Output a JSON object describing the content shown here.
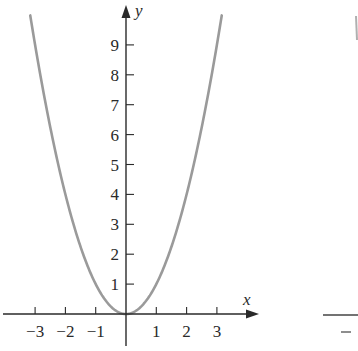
{
  "chart_data": {
    "type": "line",
    "title": "",
    "function": "y = x^2",
    "xlabel": "x",
    "ylabel": "y",
    "xlim": [
      -4.1,
      4.4
    ],
    "ylim": [
      -1.1,
      10.3
    ],
    "x_ticks": [
      -3,
      -2,
      -1,
      1,
      2,
      3
    ],
    "x_tick_labels": [
      "−3",
      "−2",
      "−1",
      "1",
      "2",
      "3"
    ],
    "y_ticks": [
      1,
      2,
      3,
      4,
      5,
      6,
      7,
      8,
      9
    ],
    "y_tick_labels": [
      "1",
      "2",
      "3",
      "4",
      "5",
      "6",
      "7",
      "8",
      "9"
    ],
    "grid": false,
    "legend": null,
    "series": [
      {
        "name": "y = x^2",
        "color": "#9a9a9a",
        "x": [
          -3.16,
          -3,
          -2.5,
          -2,
          -1.5,
          -1,
          -0.5,
          0,
          0.5,
          1,
          1.5,
          2,
          2.5,
          3,
          3.16
        ],
        "y": [
          10,
          9,
          6.25,
          4,
          2.25,
          1,
          0.25,
          0,
          0.25,
          1,
          2.25,
          4,
          6.25,
          9,
          10
        ]
      }
    ],
    "partial_second_panel": {
      "visible": true,
      "note": "cropped second graph at right edge showing a curve top and an x-axis with a minus tick label"
    }
  },
  "colors": {
    "axis": "#2a2a2a",
    "curve": "#9a9a9a",
    "background": "#ffffff"
  }
}
